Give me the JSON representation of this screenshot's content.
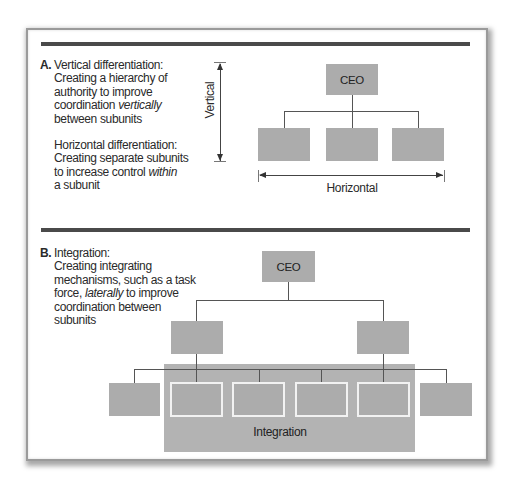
{
  "panel_a": {
    "letter": "A.",
    "vertical_title": "Vertical differentiation:",
    "vertical_body_lines": [
      "Creating a hierarchy of",
      "authority to improve"
    ],
    "vertical_line4_pre": "coordination ",
    "vertical_line4_em": "vertically",
    "vertical_line5": "between subunits",
    "horizontal_title": "Horizontal differentiation:",
    "horizontal_line2": "Creating separate subunits",
    "horizontal_line3_pre": "to increase control ",
    "horizontal_line3_em": "within",
    "horizontal_line4": "a subunit",
    "chart": {
      "top_box_label": "CEO",
      "subunit_count": 3,
      "vertical_axis_label": "Vertical",
      "horizontal_axis_label": "Horizontal"
    }
  },
  "panel_b": {
    "letter": "B.",
    "title": "Integration:",
    "line2": "Creating integrating",
    "line3": "mechanisms, such as a task",
    "line4_pre": "force, ",
    "line4_em": "laterally",
    "line4_post": " to improve",
    "line5": "coordination between",
    "line6": "subunits",
    "chart": {
      "top_box_label": "CEO",
      "middle_box_count": 2,
      "bottom_box_count": 6,
      "integrated_box_count": 4,
      "integration_label": "Integration"
    }
  },
  "colors": {
    "box_fill": "#acacac",
    "integration_panel": "#b3b3b3",
    "divider": "#4a4a4a",
    "box_outline": "#f2f2f2"
  }
}
